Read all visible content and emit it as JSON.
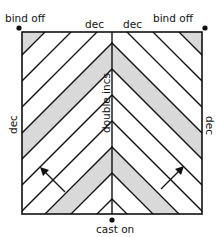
{
  "labels": {
    "top_left": "bind off",
    "top_right": "bind off",
    "top_center_left": "dec",
    "top_center_right": "dec",
    "left_side": "dec",
    "right_side": "dec",
    "center": "double incs",
    "bottom": "cast on"
  },
  "colors": {
    "line": "#111111",
    "shade": "#d9d9d9",
    "background": "#ffffff"
  }
}
